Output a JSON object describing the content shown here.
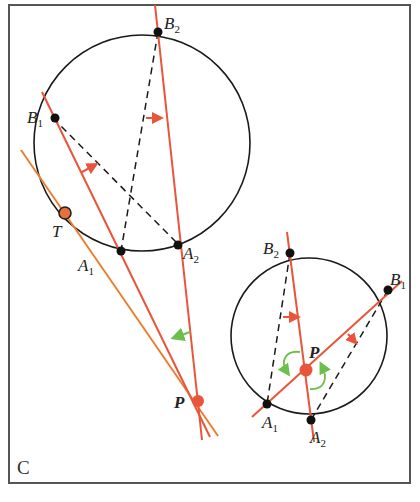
{
  "figure": {
    "panel_label": "C",
    "colors": {
      "circle": "#1a1a1a",
      "red_line": "#e8553a",
      "orange_line": "#f0a040",
      "point": "#111111",
      "highlight_point": "#e8553a",
      "green_arrow": "#6cbf4a",
      "frame": "#555555"
    },
    "left_diagram": {
      "points": {
        "B1": {
          "label": "B",
          "sub": "1"
        },
        "B2": {
          "label": "B",
          "sub": "2"
        },
        "A1": {
          "label": "A",
          "sub": "1"
        },
        "A2": {
          "label": "A",
          "sub": "2"
        },
        "T": {
          "label": "T"
        },
        "P": {
          "label": "P"
        }
      }
    },
    "right_diagram": {
      "points": {
        "B1": {
          "label": "B",
          "sub": "1"
        },
        "B2": {
          "label": "B",
          "sub": "2"
        },
        "A1": {
          "label": "A",
          "sub": "1"
        },
        "A2": {
          "label": "A",
          "sub": "2"
        },
        "P": {
          "label": "P"
        }
      }
    }
  }
}
